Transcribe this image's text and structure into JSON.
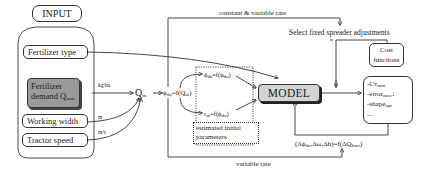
{
  "input_group": {
    "title": "INPUT",
    "items": [
      {
        "label": "Fertilizer type"
      },
      {
        "label_line1": "Fertilizer",
        "label_line2": "demand Q",
        "label_sub": "bact"
      },
      {
        "label": "Working width"
      },
      {
        "label": "Tractor speed"
      }
    ]
  },
  "units": {
    "demand": "kg/ha",
    "width": "m",
    "speed": "m/s"
  },
  "flow": {
    "qm": "Q",
    "qm_sub": "m",
    "phi_formula": "ϕ",
    "phi_sub": "do",
    "phi_rhs": "=f(Q",
    "phi_rhs_sub": "m",
    "phi_rhs_end": ")"
  },
  "estimated": {
    "phi_top": "ϕ",
    "phi_top_sub": "da",
    "phi_top_rhs": "=f(ϕ",
    "phi_top_rhs_sub": "do",
    "r_bottom": "r",
    "r_bottom_sub": "m",
    "r_bottom_rhs": "=f(ϕ",
    "r_bottom_rhs_sub": "do",
    "caption_line1": "estimated initial",
    "caption_line2": "parameters"
  },
  "model": {
    "label": "MODEL"
  },
  "top": {
    "rate_label": "constant & variable rate",
    "select_label": "Select fixed spreader adjustments"
  },
  "cost": {
    "title_line1": "Cost",
    "title_line2": "functions",
    "items": [
      {
        "prefix": "-Cv",
        "sub": "min",
        "suffix": ""
      },
      {
        "prefix": "-error",
        "sub": "max",
        "suffix": "↓"
      },
      {
        "prefix": "-shape",
        "sub": "opt",
        "suffix": ""
      },
      {
        "prefix": "...",
        "sub": "",
        "suffix": ""
      }
    ]
  },
  "bottom": {
    "delta_lhs": "(Δϕ",
    "delta_sub": "do",
    "delta_mid": ",Δω,Δh)=f(ΔQ",
    "delta_sub2": "bact",
    "delta_end": ")",
    "rate_label": "variable rate"
  },
  "colors": {
    "model_fill": "#d4d4d4",
    "demand_fill": "#9a9a9a",
    "line": "#333333"
  }
}
